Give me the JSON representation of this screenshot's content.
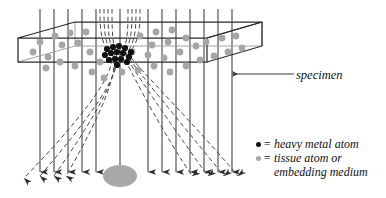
{
  "figure": {
    "type": "diagram",
    "background": "#ffffff"
  },
  "colors": {
    "beam_line": "#3a3a3a",
    "scatter_line": "#4a4a4a",
    "box_outline": "#2b2b2b",
    "box_outline_light": "#9a9a9a",
    "heavy_atom": "#111111",
    "tissue_atom": "#a6a6a6",
    "image_blob": "#a8a8a8",
    "text": "#111111",
    "leader_line": "#3a3a3a"
  },
  "annotations": {
    "specimen_label": "specimen"
  },
  "legend": {
    "rows": [
      {
        "marker": "heavy-atom-dot",
        "color": "#111111",
        "equals": "=",
        "text": "heavy metal atom",
        "continuation": ""
      },
      {
        "marker": "tissue-atom-dot",
        "color": "#a6a6a6",
        "equals": "=",
        "text": "tissue atom or",
        "continuation": "embedding medium"
      }
    ]
  },
  "specimen_box": {
    "description": "3D slab drawn in oblique projection",
    "top_face": [
      [
        18,
        38
      ],
      [
        75,
        22
      ],
      [
        262,
        22
      ],
      [
        207,
        38
      ]
    ],
    "front_face": [
      [
        18,
        38
      ],
      [
        207,
        38
      ],
      [
        207,
        62
      ],
      [
        18,
        62
      ]
    ],
    "outline_points": "top-left 18,38 | top-back-left 75,22 | top-back-right 262,22 | top-front-right 207,38 | bottom-front-right 207,62 | bottom-left 18,62"
  },
  "beam": {
    "direction": "top-to-bottom",
    "line_count": 17,
    "top_y": 9,
    "bottom_y": 176,
    "arrowhead": "solid-triangle-down",
    "x_positions": [
      40,
      54,
      68,
      82,
      96,
      100,
      104,
      108,
      112,
      116,
      120,
      134,
      148,
      162,
      176,
      190,
      204,
      218,
      232
    ]
  },
  "scatter": {
    "description": "dashed rays scattered by the heavy metal atom cluster",
    "origin": [
      118,
      56
    ],
    "style": "dashed",
    "left_fan_endpoints": [
      [
        12,
        186
      ],
      [
        34,
        188
      ],
      [
        50,
        188
      ],
      [
        62,
        186
      ]
    ],
    "right_fan_endpoints": [
      [
        196,
        186
      ],
      [
        212,
        188
      ],
      [
        226,
        188
      ],
      [
        238,
        186
      ]
    ]
  },
  "heavy_atom_cluster": {
    "center": [
      118,
      56
    ],
    "radius_px": 3.1,
    "count": 15,
    "points": [
      [
        107,
        49
      ],
      [
        113,
        47
      ],
      [
        119,
        46
      ],
      [
        125,
        48
      ],
      [
        131,
        52
      ],
      [
        105,
        55
      ],
      [
        111,
        53
      ],
      [
        117,
        52
      ],
      [
        123,
        53
      ],
      [
        129,
        57
      ],
      [
        109,
        60
      ],
      [
        115,
        59
      ],
      [
        121,
        59
      ],
      [
        127,
        62
      ],
      [
        117,
        65
      ]
    ]
  },
  "tissue_atoms": {
    "radius_px": 3.4,
    "count": 38,
    "points": [
      [
        40,
        42
      ],
      [
        55,
        36
      ],
      [
        70,
        33
      ],
      [
        86,
        32
      ],
      [
        62,
        45
      ],
      [
        78,
        43
      ],
      [
        33,
        52
      ],
      [
        48,
        57
      ],
      [
        90,
        52
      ],
      [
        46,
        68
      ],
      [
        60,
        62
      ],
      [
        75,
        66
      ],
      [
        92,
        72
      ],
      [
        104,
        78
      ],
      [
        140,
        36
      ],
      [
        156,
        32
      ],
      [
        172,
        30
      ],
      [
        152,
        45
      ],
      [
        168,
        42
      ],
      [
        186,
        38
      ],
      [
        132,
        52
      ],
      [
        148,
        55
      ],
      [
        164,
        58
      ],
      [
        180,
        52
      ],
      [
        196,
        46
      ],
      [
        122,
        72
      ],
      [
        138,
        70
      ],
      [
        154,
        66
      ],
      [
        170,
        72
      ],
      [
        186,
        66
      ],
      [
        200,
        60
      ],
      [
        214,
        56
      ],
      [
        206,
        42
      ],
      [
        222,
        38
      ],
      [
        236,
        36
      ],
      [
        228,
        52
      ],
      [
        242,
        48
      ],
      [
        100,
        62
      ]
    ]
  },
  "image_blob": {
    "center": [
      120,
      176
    ],
    "rx": 17,
    "ry": 11,
    "color": "#a8a8a8"
  },
  "leader": {
    "from": [
      296,
      74
    ],
    "to": [
      232,
      74
    ],
    "arrow": "left"
  }
}
